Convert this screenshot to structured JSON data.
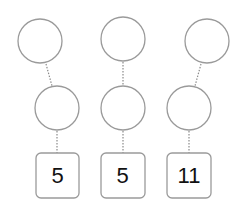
{
  "diagram": {
    "type": "tree-columns",
    "columns": [
      {
        "top_node": "",
        "middle_node": "",
        "leaf_value": "5"
      },
      {
        "top_node": "",
        "middle_node": "",
        "leaf_value": "5"
      },
      {
        "top_node": "",
        "middle_node": "",
        "leaf_value": "11"
      }
    ],
    "colors": {
      "stroke": "#9a9a9a",
      "edge": "#8a8a8a",
      "text": "#111111",
      "background": "#ffffff"
    }
  }
}
